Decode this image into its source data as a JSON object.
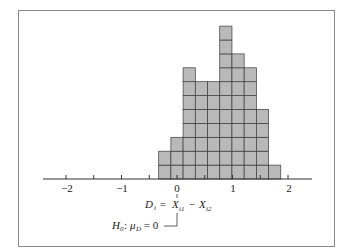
{
  "chart_data": {
    "type": "bar",
    "subtype": "histogram (stacked unit squares)",
    "title": "",
    "xlabel": "D_i = X_i1 − X_i2",
    "ylabel": "",
    "xlim": [
      -2.4,
      2.4
    ],
    "x_ticks": [
      "−2",
      "−1",
      "0",
      "1",
      "2"
    ],
    "minor_ticks": [
      -1.5,
      -0.5,
      0.5,
      1.5
    ],
    "bin_width": 0.22,
    "bin_starts": [
      -0.33,
      -0.11,
      0.11,
      0.33,
      0.55,
      0.77,
      0.99,
      1.21,
      1.43,
      1.65
    ],
    "values": [
      2,
      3,
      8,
      7,
      7,
      11,
      9,
      8,
      5,
      1
    ],
    "annotation": "H0: μD = 0",
    "grid": false,
    "legend": null
  },
  "labels": {
    "tick_neg2": "−2",
    "tick_neg1": "−1",
    "tick_0": "0",
    "tick_1": "1",
    "tick_2": "2",
    "d_label": "D",
    "d_sub": "i",
    "eq": " = ",
    "x1": "X",
    "x1_sub": "i1",
    "minus": " − ",
    "x2": "X",
    "x2_sub": "i2",
    "h0": "H",
    "h0_sub": "0",
    "colon": ": ",
    "mu": "μ",
    "mu_sub": "D",
    "eq0": " = 0"
  },
  "colors": {
    "bar_fill": "#b9b9b9",
    "bar_stroke": "#3a3a3a",
    "axis": "#333333"
  }
}
